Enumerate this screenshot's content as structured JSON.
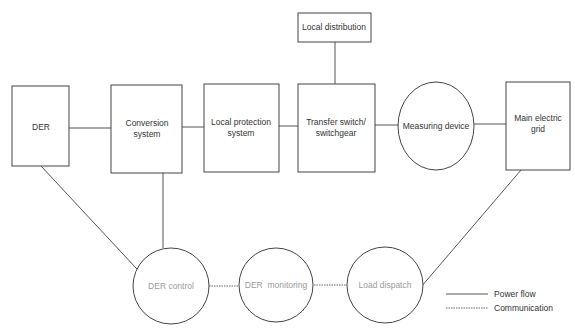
{
  "diagram": {
    "nodes": {
      "der": {
        "label": "DER",
        "shape": "rect"
      },
      "conversion": {
        "line1": "Conversion",
        "line2": "system",
        "shape": "rect"
      },
      "protection": {
        "line1": "Local protection",
        "line2": "system",
        "shape": "rect"
      },
      "transfer": {
        "line1": "Transfer switch/",
        "line2": "switchgear",
        "shape": "rect"
      },
      "measuring": {
        "label": "Measuring device",
        "shape": "ellipse"
      },
      "grid": {
        "line1": "Main electric",
        "line2": "grid",
        "shape": "rect"
      },
      "distribution": {
        "label": "Local distribution",
        "shape": "rect"
      },
      "der_control": {
        "label": "DER control",
        "shape": "circle"
      },
      "der_monitoring": {
        "label": "DER  monitoring",
        "shape": "circle"
      },
      "load_dispatch": {
        "label": "Load dispatch",
        "shape": "circle"
      }
    },
    "edges": [
      {
        "from": "DER",
        "to": "Conversion system",
        "type": "power"
      },
      {
        "from": "Conversion system",
        "to": "Local protection system",
        "type": "power"
      },
      {
        "from": "Local protection system",
        "to": "Transfer switch/switchgear",
        "type": "power"
      },
      {
        "from": "Transfer switch/switchgear",
        "to": "Local distribution",
        "type": "power"
      },
      {
        "from": "Transfer switch/switchgear",
        "to": "Measuring device",
        "type": "power"
      },
      {
        "from": "Measuring device",
        "to": "Main electric grid",
        "type": "power"
      },
      {
        "from": "DER",
        "to": "DER control",
        "type": "power"
      },
      {
        "from": "Conversion system",
        "to": "DER control",
        "type": "power"
      },
      {
        "from": "Main electric grid",
        "to": "Load dispatch",
        "type": "power"
      },
      {
        "from": "DER control",
        "to": "DER monitoring",
        "type": "communication"
      },
      {
        "from": "DER monitoring",
        "to": "Load dispatch",
        "type": "communication"
      }
    ],
    "legend": {
      "power": "Power flow",
      "communication": "Communication"
    },
    "colors": {
      "stroke": "#444444",
      "text": "#333333",
      "circle_text": "#9a9a9a"
    }
  }
}
